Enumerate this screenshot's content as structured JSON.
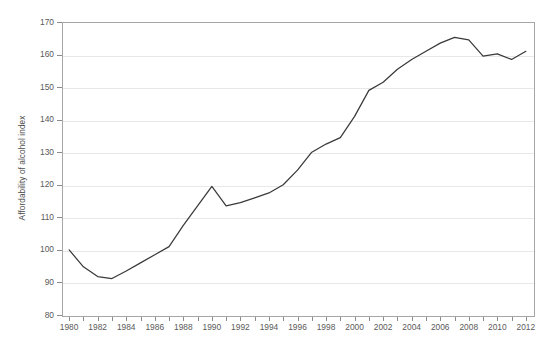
{
  "chart_data": {
    "type": "line",
    "title": "",
    "xlabel": "",
    "ylabel": "Affordability of alcohol index",
    "xlim": [
      1979.5,
      2012.5
    ],
    "ylim": [
      80,
      170
    ],
    "ytick_step": 10,
    "xtick_step": 1,
    "xtick_label_step": 2,
    "grid": "horizontal",
    "legend": "none",
    "yticks": [
      80,
      90,
      100,
      110,
      120,
      130,
      140,
      150,
      160,
      170
    ],
    "xticks": [
      1980,
      1981,
      1982,
      1983,
      1984,
      1985,
      1986,
      1987,
      1988,
      1989,
      1990,
      1991,
      1992,
      1993,
      1994,
      1995,
      1996,
      1997,
      1998,
      1999,
      2000,
      2001,
      2002,
      2003,
      2004,
      2005,
      2006,
      2007,
      2008,
      2009,
      2010,
      2011,
      2012
    ],
    "xtick_labels": [
      "1980",
      "",
      "1982",
      "",
      "1984",
      "",
      "1986",
      "",
      "1988",
      "",
      "1990",
      "",
      "1992",
      "",
      "1994",
      "",
      "1996",
      "",
      "1998",
      "",
      "2000",
      "",
      "2002",
      "",
      "2004",
      "",
      "2006",
      "",
      "2008",
      "",
      "2010",
      "",
      "2012"
    ],
    "x": [
      1980,
      1981,
      1982,
      1983,
      1984,
      1985,
      1986,
      1987,
      1988,
      1989,
      1990,
      1991,
      1992,
      1993,
      1994,
      1995,
      1996,
      1997,
      1998,
      1999,
      2000,
      2001,
      2002,
      2003,
      2004,
      2005,
      2006,
      2007,
      2008,
      2009,
      2010,
      2011,
      2012
    ],
    "values": [
      100.0,
      94.8,
      91.8,
      91.2,
      93.5,
      96.0,
      98.5,
      101.0,
      107.5,
      113.5,
      119.5,
      113.5,
      114.5,
      116.0,
      117.5,
      120.0,
      124.5,
      130.0,
      132.5,
      134.5,
      141.0,
      149.0,
      151.5,
      155.5,
      158.5,
      161.0,
      163.5,
      165.3,
      164.5,
      159.5,
      160.2,
      158.5,
      161.0
    ],
    "series_color": "#3a3a3a",
    "grid_color": "#e8e8e8",
    "axis_color": "#a6a6a6",
    "text_color": "#5a5a5a"
  }
}
